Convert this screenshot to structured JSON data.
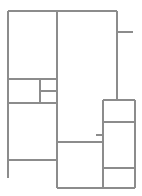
{
  "document": {
    "title": "Floor Plan Line Drawing",
    "kind": "architectural-line-drawing",
    "canvas": {
      "width": 142,
      "height": 196,
      "background": "#ffffff"
    }
  },
  "style": {
    "line_color": "#8c8c8c",
    "line_width": 1.1,
    "fill_color": "#ffffff"
  },
  "plan": {
    "bounds": {
      "x1": 8,
      "y1": 11,
      "x2": 135,
      "y2": 188
    },
    "rooms": [
      {
        "name": "upper-left-room",
        "x": 8,
        "y": 11,
        "w": 49,
        "h": 68
      },
      {
        "name": "mid-left-small-room",
        "x": 8,
        "y": 79,
        "w": 32,
        "h": 24
      },
      {
        "name": "mid-center-upper-cell",
        "x": 40,
        "y": 79,
        "w": 17,
        "h": 12
      },
      {
        "name": "mid-center-lower-cell",
        "x": 40,
        "y": 91,
        "w": 17,
        "h": 12
      },
      {
        "name": "lower-left-room",
        "x": 8,
        "y": 103,
        "w": 49,
        "h": 57
      },
      {
        "name": "central-tall-room",
        "x": 57,
        "y": 11,
        "w": 60,
        "h": 131
      },
      {
        "name": "bottom-center-room",
        "x": 57,
        "y": 142,
        "w": 46,
        "h": 46
      },
      {
        "name": "right-upper-cell",
        "x": 103,
        "y": 100,
        "w": 32,
        "h": 22
      },
      {
        "name": "right-middle-cell",
        "x": 103,
        "y": 122,
        "w": 32,
        "h": 46
      },
      {
        "name": "right-lower-cell",
        "x": 103,
        "y": 168,
        "w": 32,
        "h": 20
      }
    ],
    "segments": [
      {
        "name": "outer-top-wall",
        "x1": 8,
        "y1": 11,
        "x2": 117,
        "y2": 11
      },
      {
        "name": "outer-left-wall",
        "x1": 8,
        "y1": 11,
        "x2": 8,
        "y2": 178
      },
      {
        "name": "central-vertical-wall",
        "x1": 57,
        "y1": 11,
        "x2": 57,
        "y2": 188
      },
      {
        "name": "upper-right-vertical-wall",
        "x1": 117,
        "y1": 11,
        "x2": 117,
        "y2": 100
      },
      {
        "name": "right-stub-tick",
        "x1": 117,
        "y1": 32,
        "x2": 133,
        "y2": 32
      },
      {
        "name": "mid-left-divider-top",
        "x1": 8,
        "y1": 79,
        "x2": 57,
        "y2": 79
      },
      {
        "name": "mid-cell-vertical-divider",
        "x1": 40,
        "y1": 79,
        "x2": 40,
        "y2": 103
      },
      {
        "name": "mid-cell-horizontal-divider",
        "x1": 40,
        "y1": 91,
        "x2": 57,
        "y2": 91
      },
      {
        "name": "lower-left-divider-top",
        "x1": 8,
        "y1": 103,
        "x2": 57,
        "y2": 103
      },
      {
        "name": "lower-left-divider-bottom",
        "x1": 8,
        "y1": 160,
        "x2": 57,
        "y2": 160
      },
      {
        "name": "bottom-center-divider",
        "x1": 57,
        "y1": 142,
        "x2": 103,
        "y2": 142
      },
      {
        "name": "outer-bottom-wall",
        "x1": 57,
        "y1": 188,
        "x2": 135,
        "y2": 188
      },
      {
        "name": "right-box-top-wall",
        "x1": 103,
        "y1": 100,
        "x2": 135,
        "y2": 100
      },
      {
        "name": "right-box-left-wall",
        "x1": 103,
        "y1": 100,
        "x2": 103,
        "y2": 188
      },
      {
        "name": "right-box-right-wall",
        "x1": 135,
        "y1": 100,
        "x2": 135,
        "y2": 188
      },
      {
        "name": "right-box-divider-upper",
        "x1": 103,
        "y1": 122,
        "x2": 135,
        "y2": 122
      },
      {
        "name": "right-box-divider-lower",
        "x1": 103,
        "y1": 168,
        "x2": 135,
        "y2": 168
      },
      {
        "name": "corridor-connector",
        "x1": 96,
        "y1": 135,
        "x2": 103,
        "y2": 135
      }
    ]
  }
}
